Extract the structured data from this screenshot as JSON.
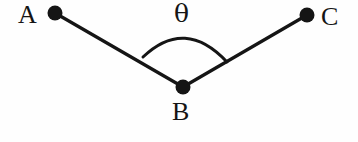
{
  "figure": {
    "kind": "geometry-angle-diagram",
    "background_color": "#fefefe",
    "stroke_color": "#151515",
    "width": 358,
    "height": 142,
    "points": [
      {
        "id": "A",
        "label": "A",
        "x": 55,
        "y": 13,
        "dot_radius": 7.5
      },
      {
        "id": "B",
        "label": "B",
        "x": 183,
        "y": 87,
        "dot_radius": 7.5
      },
      {
        "id": "C",
        "label": "C",
        "x": 307,
        "y": 15,
        "dot_radius": 7.5
      }
    ],
    "segments": [
      {
        "id": "BA",
        "from": "B",
        "to": "A",
        "stroke_width": 3.2
      },
      {
        "id": "BC",
        "from": "B",
        "to": "C",
        "stroke_width": 3.2
      }
    ],
    "arc": {
      "id": "angle-arc-theta",
      "start_x": 143,
      "start_y": 57,
      "end_x": 227,
      "end_y": 62,
      "apex_x": 185,
      "apex_y": 33,
      "stroke_width": 3.0
    },
    "angle_symbol": {
      "id": "theta",
      "glyph": "θ",
      "at_vertex": "B"
    },
    "labels": {
      "a": "A",
      "b": "B",
      "c": "C",
      "theta": "θ"
    }
  }
}
